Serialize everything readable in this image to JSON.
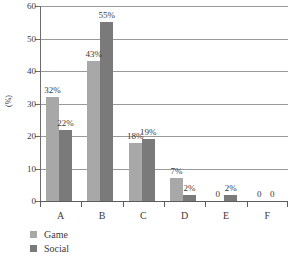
{
  "chart_data": {
    "type": "bar",
    "title": "",
    "xlabel": "",
    "ylabel": "(%)",
    "categories": [
      "A",
      "B",
      "C",
      "D",
      "E",
      "F"
    ],
    "series": [
      {
        "name": "Game",
        "color": "#a8a8a8",
        "values": [
          32,
          43,
          18,
          7,
          0,
          0
        ],
        "labels": [
          "32%",
          "43%",
          "18%",
          "7%",
          "0",
          "0"
        ]
      },
      {
        "name": "Social",
        "color": "#7a7a7a",
        "values": [
          22,
          55,
          19,
          2,
          2,
          0
        ],
        "labels": [
          "22%",
          "55%",
          "19%",
          "2%",
          "2%",
          "0"
        ]
      }
    ],
    "ylim": [
      0,
      60
    ],
    "yticks": [
      0,
      10,
      20,
      30,
      40,
      50,
      60
    ],
    "ytick_labels": [
      "0",
      "10",
      "20",
      "30",
      "40",
      "50",
      "60"
    ],
    "grid": true,
    "legend_position": "bottom-left"
  },
  "legend": {
    "items": [
      {
        "label": "Game",
        "color": "#a8a8a8"
      },
      {
        "label": "Social",
        "color": "#7a7a7a"
      }
    ]
  }
}
